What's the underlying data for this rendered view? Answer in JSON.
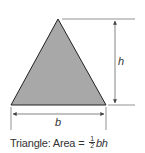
{
  "diagram": {
    "shape": "triangle",
    "fill_color": "#a8a8a8",
    "stroke_color": "#222222",
    "dimension_line_color": "#555555",
    "labels": {
      "height": "h",
      "base": "b"
    },
    "caption": {
      "prefix": "Triangle: Area = ",
      "fraction_numerator": "1",
      "fraction_denominator": "2",
      "suffix": "bh"
    }
  }
}
